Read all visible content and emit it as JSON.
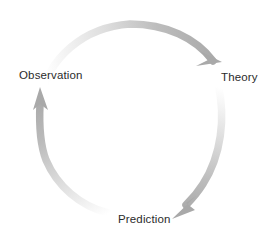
{
  "diagram": {
    "type": "cycle",
    "title": "",
    "background_color": "#ffffff",
    "canvas": {
      "width": 260,
      "height": 237
    },
    "circle": {
      "center_x": 130,
      "center_y": 118,
      "radius": 93
    },
    "label_color": "#2b2b2b",
    "arrow_color_dark": "#a9a9a9",
    "arrow_color_light": "#f7f7f7",
    "nodes": [
      {
        "id": "observation",
        "label": "Observation",
        "position": "left",
        "angle_deg": 180
      },
      {
        "id": "theory",
        "label": "Theory",
        "position": "right",
        "angle_deg": 0
      },
      {
        "id": "prediction",
        "label": "Prediction",
        "position": "bottom",
        "angle_deg": 90
      }
    ],
    "arrows": [
      {
        "id": "observation-to-theory",
        "from": "observation",
        "to": "theory",
        "path": "top-arc",
        "direction": "clockwise",
        "head_at": {
          "x": 222,
          "y": 56
        }
      },
      {
        "id": "theory-to-prediction",
        "from": "theory",
        "to": "prediction",
        "path": "right-arc",
        "direction": "clockwise",
        "head_at": {
          "x": 175,
          "y": 218
        }
      },
      {
        "id": "prediction-to-observation",
        "from": "prediction",
        "to": "observation",
        "path": "left-arc",
        "direction": "clockwise",
        "head_at": {
          "x": 40,
          "y": 88
        }
      }
    ]
  }
}
